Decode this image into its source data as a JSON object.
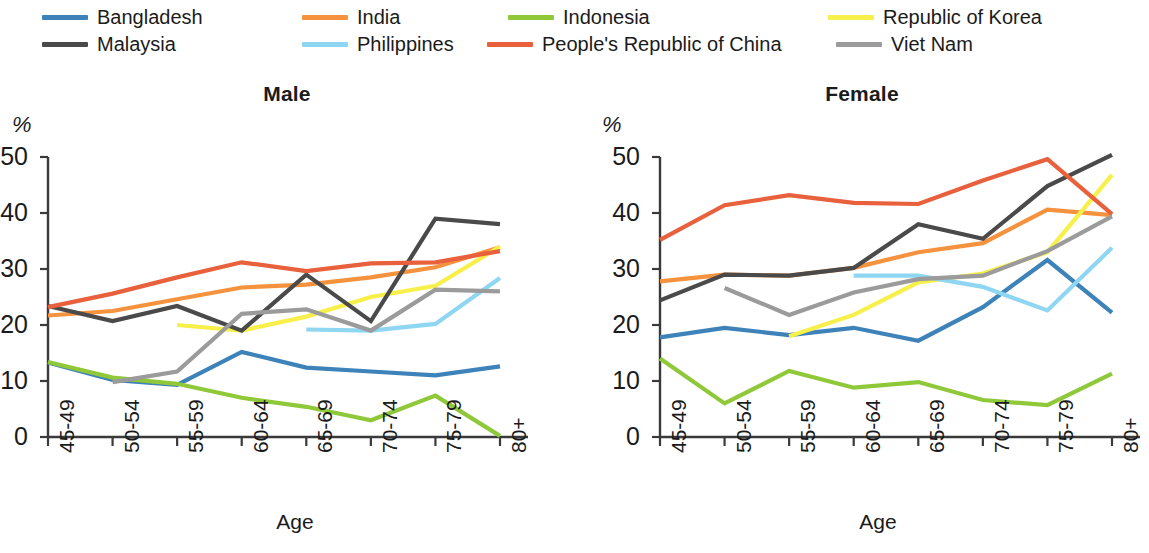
{
  "legend": {
    "items": [
      {
        "label": "Bangladesh",
        "color": "#3d82b8",
        "row": 0,
        "x": 42
      },
      {
        "label": "India",
        "color": "#f5923e",
        "row": 0,
        "x": 302
      },
      {
        "label": "Indonesia",
        "color": "#8fc93a",
        "row": 0,
        "x": 508
      },
      {
        "label": "Republic of Korea",
        "color": "#f7f04a",
        "row": 0,
        "x": 828
      },
      {
        "label": "Malaysia",
        "color": "#4a4a4a",
        "row": 1,
        "x": 42
      },
      {
        "label": "Philippines",
        "color": "#8ed6f2",
        "row": 1,
        "x": 302
      },
      {
        "label": "People's Republic of China",
        "color": "#e8603c",
        "row": 1,
        "x": 487
      },
      {
        "label": "Viet Nam",
        "color": "#9b9b9b",
        "row": 1,
        "x": 836
      }
    ]
  },
  "chart_data": [
    {
      "type": "line",
      "title": "Male",
      "xlabel": "Age",
      "ylabel": "%",
      "categories": [
        "45-49",
        "50-54",
        "55-59",
        "60-64",
        "65-69",
        "70-74",
        "75-79",
        "80+"
      ],
      "ylim": [
        0,
        50
      ],
      "yticks": [
        0,
        10,
        20,
        30,
        40,
        50
      ],
      "grid": false,
      "legend_position": "top",
      "series": [
        {
          "name": "Bangladesh",
          "color": "#3d82b8",
          "values": [
            13.3,
            10.2,
            9.3,
            15.2,
            12.4,
            11.7,
            11.0,
            12.6
          ]
        },
        {
          "name": "India",
          "color": "#f5923e",
          "values": [
            21.7,
            22.5,
            24.6,
            26.7,
            27.2,
            28.5,
            30.3,
            33.9
          ]
        },
        {
          "name": "Indonesia",
          "color": "#8fc93a",
          "values": [
            13.4,
            10.6,
            9.5,
            7.0,
            5.4,
            3.0,
            7.4,
            0.2
          ]
        },
        {
          "name": "Republic of Korea",
          "color": "#f7f04a",
          "values": [
            null,
            null,
            20.0,
            19.0,
            21.5,
            25.0,
            27.0,
            34.0
          ]
        },
        {
          "name": "Malaysia",
          "color": "#4a4a4a",
          "values": [
            23.4,
            20.7,
            23.4,
            19.0,
            29.0,
            20.7,
            39.0,
            38.0
          ]
        },
        {
          "name": "Philippines",
          "color": "#8ed6f2",
          "values": [
            null,
            null,
            null,
            null,
            19.2,
            19.0,
            20.2,
            28.4
          ]
        },
        {
          "name": "People's Republic of China",
          "color": "#e8603c",
          "values": [
            23.2,
            25.6,
            28.5,
            31.2,
            29.6,
            31.0,
            31.2,
            33.2
          ]
        },
        {
          "name": "Viet Nam",
          "color": "#9b9b9b",
          "values": [
            null,
            9.8,
            11.7,
            22.0,
            22.8,
            19.0,
            26.3,
            26.0
          ]
        }
      ]
    },
    {
      "type": "line",
      "title": "Female",
      "xlabel": "Age",
      "ylabel": "%",
      "categories": [
        "45-49",
        "50-54",
        "55-59",
        "60-64",
        "65-69",
        "70-74",
        "75-79",
        "80+"
      ],
      "ylim": [
        0,
        50
      ],
      "yticks": [
        0,
        10,
        20,
        30,
        40,
        50
      ],
      "grid": false,
      "legend_position": "top",
      "series": [
        {
          "name": "Bangladesh",
          "color": "#3d82b8",
          "values": [
            17.8,
            19.5,
            18.2,
            19.5,
            17.2,
            23.2,
            31.6,
            22.2
          ]
        },
        {
          "name": "India",
          "color": "#f5923e",
          "values": [
            27.8,
            29.0,
            28.8,
            30.2,
            33.0,
            34.6,
            40.6,
            39.6
          ]
        },
        {
          "name": "Indonesia",
          "color": "#8fc93a",
          "values": [
            14.0,
            6.0,
            11.8,
            8.8,
            9.8,
            6.6,
            5.7,
            11.3
          ]
        },
        {
          "name": "Republic of Korea",
          "color": "#f7f04a",
          "values": [
            null,
            null,
            18.0,
            21.8,
            27.6,
            29.2,
            33.0,
            46.8
          ]
        },
        {
          "name": "Malaysia",
          "color": "#4a4a4a",
          "values": [
            24.4,
            29.0,
            28.8,
            30.2,
            38.0,
            35.4,
            44.8,
            50.4
          ]
        },
        {
          "name": "Philippines",
          "color": "#8ed6f2",
          "values": [
            null,
            null,
            null,
            28.8,
            28.8,
            26.8,
            22.6,
            33.8
          ]
        },
        {
          "name": "People's Republic of China",
          "color": "#e8603c",
          "values": [
            35.2,
            41.4,
            43.2,
            41.8,
            41.6,
            45.8,
            49.6,
            39.8
          ]
        },
        {
          "name": "Viet Nam",
          "color": "#9b9b9b",
          "values": [
            null,
            26.6,
            21.8,
            25.8,
            28.2,
            28.8,
            33.2,
            39.4
          ]
        }
      ]
    }
  ]
}
